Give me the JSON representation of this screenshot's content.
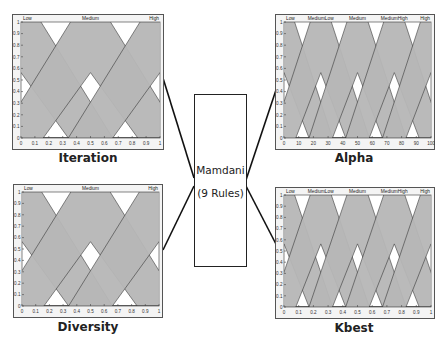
{
  "center_box": {
    "line1": "Mamdani",
    "line2": "(9 Rules)"
  },
  "colors": {
    "fill": "#b7b7b7",
    "plot_bg": "#ffffff",
    "frame": "#555555",
    "line": "#333333"
  },
  "chart_data": [
    {
      "id": "iteration",
      "type": "area",
      "title": "Iteration",
      "labels": [
        "Low",
        "Medium",
        "High"
      ],
      "xlim": [
        0,
        1
      ],
      "ylim": [
        0,
        1
      ],
      "xticks": [
        "0",
        "0.1",
        "0.2",
        "0.3",
        "0.4",
        "0.5",
        "0.6",
        "0.7",
        "0.8",
        "0.9",
        "1"
      ],
      "yticks": [
        "0",
        "0.1",
        "0.2",
        "0.3",
        "0.4",
        "0.5",
        "0.6",
        "0.7",
        "0.8",
        "0.9",
        "1"
      ],
      "series": [
        {
          "name": "Low",
          "upper": [
            [
              0,
              1
            ],
            [
              0.12,
              1
            ],
            [
              0.5,
              0
            ]
          ],
          "lower": [
            [
              0,
              0.75
            ],
            [
              0.38,
              0
            ]
          ]
        },
        {
          "name": "Medium",
          "upper": [
            [
              0.12,
              0
            ],
            [
              0.38,
              1
            ],
            [
              0.62,
              1
            ],
            [
              0.88,
              0
            ]
          ],
          "lower": [
            [
              0.38,
              0
            ],
            [
              0.5,
              0.75
            ],
            [
              0.62,
              0
            ]
          ]
        },
        {
          "name": "High",
          "upper": [
            [
              0.5,
              0
            ],
            [
              0.88,
              1
            ],
            [
              1,
              1
            ]
          ],
          "lower": [
            [
              0.62,
              0
            ],
            [
              1,
              0.75
            ]
          ]
        }
      ]
    },
    {
      "id": "alpha",
      "type": "area",
      "title": "Alpha",
      "labels": [
        "Low",
        "MediumLow",
        "Medium",
        "MediumHigh",
        "High"
      ],
      "xlim": [
        0,
        100
      ],
      "ylim": [
        0,
        1
      ],
      "xticks": [
        "0",
        "10",
        "20",
        "30",
        "40",
        "50",
        "60",
        "70",
        "80",
        "90",
        "100"
      ],
      "yticks": [
        "0",
        "0.1",
        "0.2",
        "0.3",
        "0.4",
        "0.5",
        "0.6",
        "0.7",
        "0.8",
        "0.9",
        "1"
      ],
      "series": [
        {
          "name": "Low",
          "peak": 0
        },
        {
          "name": "MediumLow",
          "peak": 25
        },
        {
          "name": "Medium",
          "peak": 50
        },
        {
          "name": "MediumHigh",
          "peak": 75
        },
        {
          "name": "High",
          "peak": 100
        }
      ]
    },
    {
      "id": "diversity",
      "type": "area",
      "title": "Diversity",
      "labels": [
        "Low",
        "Medium",
        "High"
      ],
      "xlim": [
        0,
        1
      ],
      "ylim": [
        0,
        1
      ],
      "xticks": [
        "0",
        "0.1",
        "0.2",
        "0.3",
        "0.4",
        "0.5",
        "0.6",
        "0.7",
        "0.8",
        "0.9",
        "1"
      ],
      "yticks": [
        "0",
        "0.1",
        "0.2",
        "0.3",
        "0.4",
        "0.5",
        "0.6",
        "0.7",
        "0.8",
        "0.9",
        "1"
      ],
      "series": [
        {
          "name": "Low",
          "peak": 0
        },
        {
          "name": "Medium",
          "peak": 0.5
        },
        {
          "name": "High",
          "peak": 1
        }
      ]
    },
    {
      "id": "kbest",
      "type": "area",
      "title": "Kbest",
      "labels": [
        "Low",
        "MediumLow",
        "Medium",
        "MediumHigh",
        "High"
      ],
      "xlim": [
        0,
        1
      ],
      "ylim": [
        0,
        1
      ],
      "xticks": [
        "0",
        "0.1",
        "0.2",
        "0.3",
        "0.4",
        "0.5",
        "0.6",
        "0.7",
        "0.8",
        "0.9",
        "1"
      ],
      "yticks": [
        "0",
        "0.1",
        "0.2",
        "0.3",
        "0.4",
        "0.5",
        "0.6",
        "0.7",
        "0.8",
        "0.9",
        "1"
      ],
      "series": [
        {
          "name": "Low",
          "peak": 0
        },
        {
          "name": "MediumLow",
          "peak": 0.25
        },
        {
          "name": "Medium",
          "peak": 0.5
        },
        {
          "name": "MediumHigh",
          "peak": 0.75
        },
        {
          "name": "High",
          "peak": 1
        }
      ]
    }
  ]
}
